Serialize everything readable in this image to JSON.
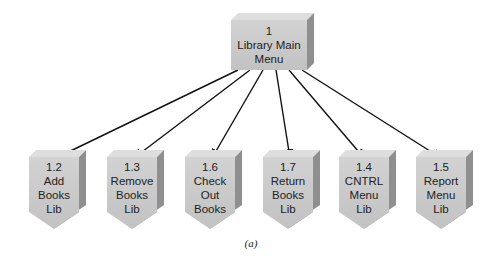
{
  "diagram": {
    "type": "structure-chart",
    "root": {
      "id": "1",
      "lines": [
        "1",
        "Library Main",
        "Menu"
      ]
    },
    "children": [
      {
        "id": "1.2",
        "lines": [
          "1.2",
          "Add",
          "Books",
          "Lib"
        ]
      },
      {
        "id": "1.3",
        "lines": [
          "1.3",
          "Remove",
          "Books",
          "Lib"
        ]
      },
      {
        "id": "1.6",
        "lines": [
          "1.6",
          "Check",
          "Out",
          "Books"
        ]
      },
      {
        "id": "1.7",
        "lines": [
          "1.7",
          "Return",
          "Books",
          "Lib"
        ]
      },
      {
        "id": "1.4",
        "lines": [
          "1.4",
          "CNTRL",
          "Menu",
          "Lib"
        ]
      },
      {
        "id": "1.5",
        "lines": [
          "1.5",
          "Report",
          "Menu",
          "Lib"
        ]
      }
    ],
    "caption": "(a)",
    "colors": {
      "front": "#c9c9c9",
      "top": "#dedede",
      "side": "#8f8f8f",
      "arrow": "#111111"
    }
  }
}
